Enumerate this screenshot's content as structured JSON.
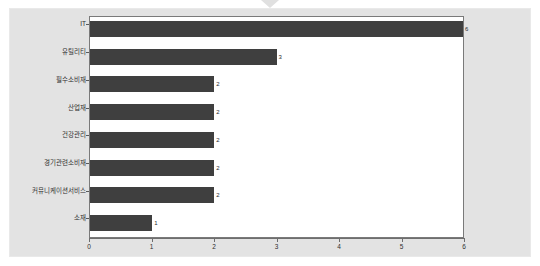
{
  "window": {
    "notch_icon": "chevron-down-icon",
    "background_color": "#e3e3e3"
  },
  "chart_data": {
    "type": "bar",
    "orientation": "horizontal",
    "title": "",
    "subtitle": "",
    "xlabel": "",
    "ylabel": "",
    "categories": [
      "IT",
      "유틸리티",
      "필수소비재",
      "산업재",
      "건강관리",
      "경기관련소비재",
      "커뮤니케이션서비스",
      "소재"
    ],
    "values": [
      6,
      3,
      2,
      2,
      2,
      2,
      2,
      1
    ],
    "data_labels": [
      "6",
      "3",
      "2",
      "2",
      "2",
      "2",
      "2",
      "1"
    ],
    "xlim": [
      0,
      6
    ],
    "xticks": [
      0,
      1,
      2,
      3,
      4,
      5,
      6
    ],
    "xtick_labels": [
      "0",
      "1",
      "2",
      "3",
      "4",
      "5",
      "6"
    ],
    "grid": false,
    "legend": false,
    "bar_color": "#3f3f3f",
    "plot_background": "#ffffff",
    "axis_color": "#6e6e6e"
  }
}
